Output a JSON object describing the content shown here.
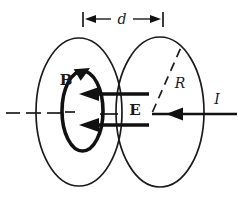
{
  "figure": {
    "labels": {
      "plate_separation": "d",
      "magnetic_field": "B",
      "electric_field": "E",
      "plate_radius": "R",
      "current": "I"
    },
    "colors": {
      "ink": "#1b1b1b",
      "bold_ink": "#111111",
      "background": "#ffffff"
    }
  }
}
